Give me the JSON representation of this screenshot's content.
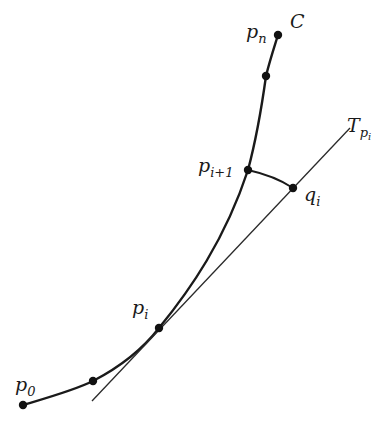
{
  "figure": {
    "labels": {
      "pn": "p",
      "pn_sub": "n",
      "C": "C",
      "pi1": "p",
      "pi1_sub": "i+1",
      "qi": "q",
      "qi_sub": "i",
      "T": "T",
      "T_sub": "p",
      "T_subsub": "i",
      "pi": "p",
      "pi_sub": "i",
      "p0": "p",
      "p0_sub": "0"
    },
    "colors": {
      "curve": "#1a1a1a",
      "tangent": "#2a2a2a",
      "point": "#111111"
    }
  }
}
